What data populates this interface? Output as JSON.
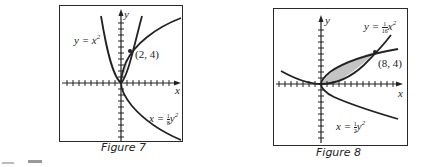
{
  "figures": [
    {
      "id": "figure-7",
      "caption": "Figure 7",
      "curves": [
        {
          "label_lhs": "y = x",
          "exponent": "2",
          "equation": "y = x^2"
        },
        {
          "label_lhs": "x = ",
          "frac_num": "1",
          "frac_den": "8",
          "label_rhs": "y",
          "exponent": "2",
          "equation": "x = (1/8)y^2"
        }
      ],
      "point_label": "(2, 4)",
      "axis_x": "x",
      "axis_y": "y"
    },
    {
      "id": "figure-8",
      "caption": "Figure 8",
      "curves": [
        {
          "label_lhs": "y = ",
          "frac_num": "1",
          "frac_den": "16",
          "label_rhs": "x",
          "exponent": "2",
          "equation": "y = (1/16)x^2"
        },
        {
          "label_lhs": "x = ",
          "frac_num": "1",
          "frac_den": "2",
          "label_rhs": "y",
          "exponent": "2",
          "equation": "x = (1/2)y^2"
        }
      ],
      "point_label": "(8, 4)",
      "axis_x": "x",
      "axis_y": "y"
    }
  ],
  "colors": {
    "line": "#222222",
    "shade": "#c4c4c4",
    "frame": "#2a2a2a"
  }
}
